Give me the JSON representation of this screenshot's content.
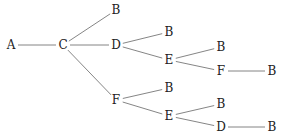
{
  "diagram": {
    "type": "tree",
    "nodes": [
      {
        "id": "n0",
        "label": "A",
        "x": 11,
        "y": 45
      },
      {
        "id": "n1",
        "label": "C",
        "x": 63,
        "y": 45
      },
      {
        "id": "n2",
        "label": "B",
        "x": 116,
        "y": 10
      },
      {
        "id": "n3",
        "label": "D",
        "x": 116,
        "y": 45
      },
      {
        "id": "n4",
        "label": "B",
        "x": 169,
        "y": 32
      },
      {
        "id": "n5",
        "label": "E",
        "x": 169,
        "y": 60
      },
      {
        "id": "n6",
        "label": "B",
        "x": 221,
        "y": 47
      },
      {
        "id": "n7",
        "label": "F",
        "x": 221,
        "y": 71
      },
      {
        "id": "n8",
        "label": "B",
        "x": 272,
        "y": 71
      },
      {
        "id": "n9",
        "label": "F",
        "x": 116,
        "y": 100
      },
      {
        "id": "n10",
        "label": "B",
        "x": 169,
        "y": 88
      },
      {
        "id": "n11",
        "label": "E",
        "x": 169,
        "y": 116
      },
      {
        "id": "n12",
        "label": "B",
        "x": 221,
        "y": 104
      },
      {
        "id": "n13",
        "label": "D",
        "x": 221,
        "y": 127
      },
      {
        "id": "n14",
        "label": "B",
        "x": 272,
        "y": 127
      }
    ],
    "edges": [
      [
        "n0",
        "n1"
      ],
      [
        "n1",
        "n2"
      ],
      [
        "n1",
        "n3"
      ],
      [
        "n1",
        "n9"
      ],
      [
        "n3",
        "n4"
      ],
      [
        "n3",
        "n5"
      ],
      [
        "n5",
        "n6"
      ],
      [
        "n5",
        "n7"
      ],
      [
        "n7",
        "n8"
      ],
      [
        "n9",
        "n10"
      ],
      [
        "n9",
        "n11"
      ],
      [
        "n11",
        "n12"
      ],
      [
        "n11",
        "n13"
      ],
      [
        "n13",
        "n14"
      ]
    ]
  }
}
